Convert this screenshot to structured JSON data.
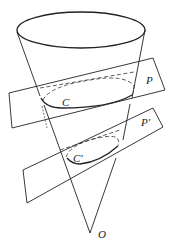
{
  "figure": {
    "labels": {
      "plane_upper": "P",
      "plane_lower": "P′",
      "section_upper": "C",
      "section_lower": "C′",
      "apex": "O"
    }
  }
}
